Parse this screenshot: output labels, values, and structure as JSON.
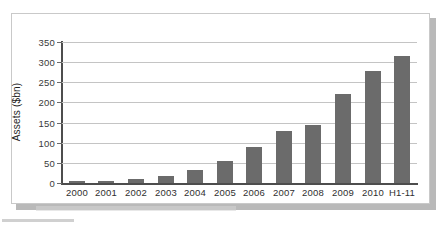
{
  "chart_data": {
    "type": "bar",
    "title": "",
    "subtitle": "",
    "xlabel": "",
    "ylabel": "Assets ($bn)",
    "categories": [
      "2000",
      "2001",
      "2002",
      "2003",
      "2004",
      "2005",
      "2006",
      "2007",
      "2008",
      "2009",
      "2010",
      "H1-11"
    ],
    "values": [
      5,
      4,
      10,
      18,
      32,
      55,
      89,
      128,
      143,
      222,
      278,
      315
    ],
    "series": [
      {
        "name": "Assets",
        "values": [
          5,
          4,
          10,
          18,
          32,
          55,
          89,
          128,
          143,
          222,
          278,
          315
        ]
      }
    ],
    "ylim": [
      0,
      350
    ],
    "yticks": [
      0,
      50,
      100,
      150,
      200,
      250,
      300,
      350
    ],
    "ytick_labels": [
      "0",
      "50",
      "100",
      "150",
      "200",
      "250",
      "300",
      "350"
    ],
    "grid": true,
    "grid_axis": "y",
    "legend": false,
    "legend_position": "none",
    "bar_color": "#6b6b6b",
    "gridline_color": "#c4c4c4",
    "axis_color": "#4d4d4d",
    "background_color": "#ffffff",
    "frame_border_color": "#c9c9c9",
    "shadow_color": "#b9b9b9"
  }
}
